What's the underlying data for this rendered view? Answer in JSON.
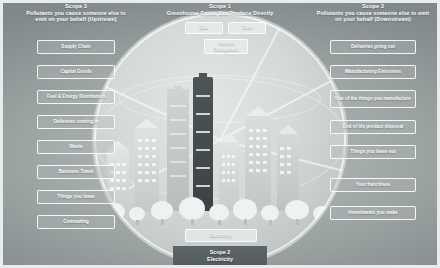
{
  "diagram": {
    "title_scope1": "Scope 1",
    "subtitle_scope1": "Greenhouse Gases You Produce Directly",
    "title_scope3_up": "Scope 3",
    "subtitle_scope3_up": "Pollutants you cause someone else to emit on your behalf (Upstream)",
    "title_scope3_down": "Scope 3",
    "subtitle_scope3_down": "Pollutants you cause someone else to emit on your behalf (Downstream)",
    "scope2_title": "Scope 2",
    "scope2_subtitle": "Electricity"
  },
  "colors": {
    "frame": "#e9ecec",
    "background": "#9aa1a1",
    "globe": "#d4d9d8",
    "box_border": "#fcfefe",
    "text": "#fbfdfd",
    "scope2_band": "#5f6668"
  },
  "upstream_items": [
    {
      "label": "Supply Chain"
    },
    {
      "label": "Capital Goods"
    },
    {
      "label": "Fuel & Energy Distribution"
    },
    {
      "label": "Deliveries coming in"
    },
    {
      "label": "Waste"
    },
    {
      "label": "Business Travel"
    },
    {
      "label": "Things you lease"
    },
    {
      "label": "Commuting"
    }
  ],
  "downstream_items": [
    {
      "label": "Deliveries going out"
    },
    {
      "label": "Manufacturing Emissions"
    },
    {
      "label": "Use of the things you manufacture"
    },
    {
      "label": "End of life product disposal"
    },
    {
      "label": "Things you lease out"
    },
    {
      "label": "Your franchises"
    },
    {
      "label": "Investments you make"
    }
  ],
  "direct_items": [
    {
      "label": "Gas"
    },
    {
      "label": "Fuel"
    },
    {
      "label": "Air-con Refrigerant"
    }
  ],
  "electricity_item": {
    "label": "Electricity"
  }
}
